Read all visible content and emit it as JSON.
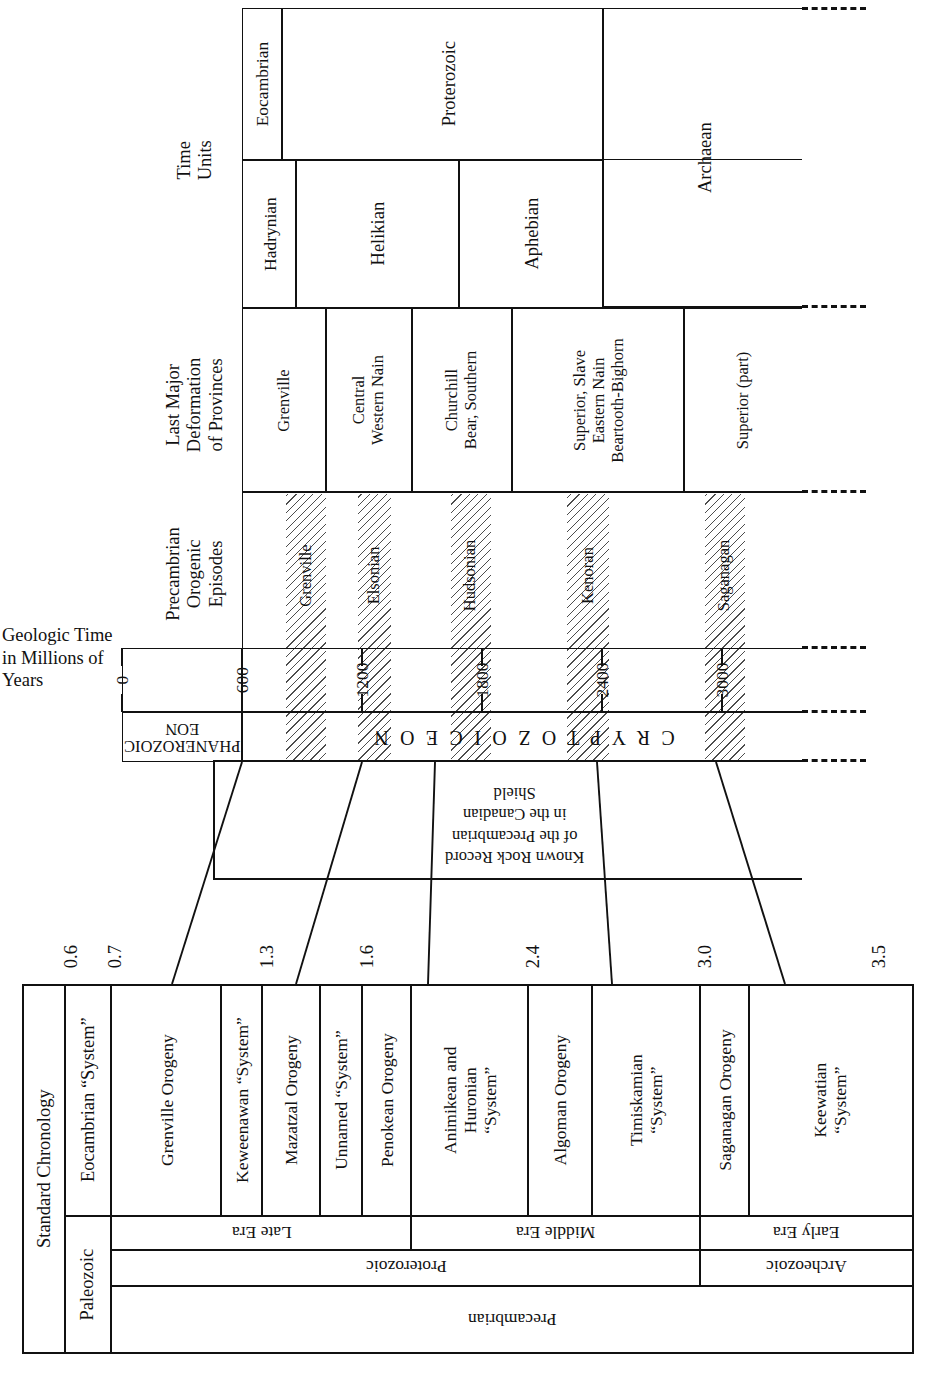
{
  "figure": {
    "orientation": "rotated-90",
    "axis_title": "Geologic Time\nin Millions of\nYears",
    "axis_title_lines": [
      "Geologic Time",
      "in Millions of",
      "Years"
    ],
    "eons": {
      "phanerozoic": "PHANEROZOIC\nEON",
      "phanerozoic_line1": "PHANEROZOIC",
      "phanerozoic_line2": "EON",
      "cryptozoic": "C R Y P T O Z O I C   E O N"
    },
    "rock_record_label_lines": [
      "Known Rock Record",
      "of the Precambrian",
      "in the Canadian",
      "Shield"
    ]
  },
  "axis": {
    "unit": "millions of years",
    "min": 0,
    "max": 3400,
    "ticks": [
      0,
      600,
      1200,
      1800,
      2400,
      3000
    ],
    "tick_labels": [
      "0",
      "600",
      "1200",
      "1800",
      "2400",
      "3000"
    ]
  },
  "columns": {
    "time_units": {
      "header_lines": [
        "Time",
        "Units"
      ]
    },
    "last_deformation": {
      "header_lines": [
        "Last Major",
        "Deformation",
        "of Provinces"
      ]
    },
    "orogenic_episodes": {
      "header_lines": [
        "Precambrian",
        "Orogenic",
        "Episodes"
      ]
    },
    "standard_chronology": {
      "header": "Standard Chronology"
    }
  },
  "time_units_upper": [
    {
      "label": "Eocambrian",
      "start": 600,
      "end": 700
    },
    {
      "label": "Proterozoic",
      "start": 700,
      "end": 2500
    },
    {
      "label": "Archaean",
      "start": 2500,
      "end": 3400
    }
  ],
  "time_units_lower": [
    {
      "label": "Hadrynian",
      "start": 600,
      "end": 880
    },
    {
      "label": "Helikian",
      "start": 880,
      "end": 1740
    },
    {
      "label": "Aphebian",
      "start": 1740,
      "end": 2500
    }
  ],
  "last_deformation": [
    {
      "lines": [
        "Grenville"
      ],
      "start": 700,
      "end": 1190
    },
    {
      "lines": [
        "Central",
        "Western Nain"
      ],
      "start": 1190,
      "end": 1620
    },
    {
      "lines": [
        "Churchill",
        "Bear, Southern"
      ],
      "start": 1620,
      "end": 2120
    },
    {
      "lines": [
        "Superior, Slave",
        "Eastern Nain",
        "Beartooth-Bighorn"
      ],
      "start": 2120,
      "end": 2980
    },
    {
      "lines": [
        "Superior  (part)"
      ],
      "start": 2980,
      "end": 3400
    }
  ],
  "orogenic_episodes": [
    {
      "label": "Grenville",
      "start": 820,
      "end": 1015,
      "hatched": true
    },
    {
      "label": "Elsonian",
      "start": 1290,
      "end": 1440,
      "hatched": true
    },
    {
      "label": "Hudsonian",
      "start": 1680,
      "end": 1880,
      "hatched": true
    },
    {
      "label": "Kenoran",
      "start": 2380,
      "end": 2600,
      "hatched": true
    },
    {
      "label": "Saganagan",
      "start": 3000,
      "end": 3200,
      "hatched": true
    }
  ],
  "standard_chronology": {
    "scale_labels": [
      "0.6",
      "0.7",
      "1.3",
      "1.6",
      "2.4",
      "3.0",
      "3.5"
    ],
    "systems": [
      {
        "label_lines": [
          "Eocambrian “System”"
        ],
        "narrow": true
      },
      {
        "label_lines": [
          "Grenville Orogeny"
        ]
      },
      {
        "label_lines": [
          "Keweenawan “System”"
        ],
        "narrow": true
      },
      {
        "label_lines": [
          "Mazatzal Orogeny"
        ]
      },
      {
        "label_lines": [
          "Unnamed “System”"
        ],
        "narrow": true
      },
      {
        "label_lines": [
          "Penokean Orogeny"
        ]
      },
      {
        "label_lines": [
          "Animikean and",
          "Huronian",
          "“System”"
        ]
      },
      {
        "label_lines": [
          "Algoman Orogeny"
        ]
      },
      {
        "label_lines": [
          "Timiskamian",
          "“System”"
        ]
      },
      {
        "label_lines": [
          "Saganagan Orogeny"
        ]
      },
      {
        "label_lines": [
          "Keewatian",
          "“System”"
        ]
      }
    ],
    "eras": [
      {
        "label": "Late Era"
      },
      {
        "label": "Middle Era"
      },
      {
        "label": "Early Era"
      }
    ],
    "erathems": [
      {
        "label": "Proterozoic"
      },
      {
        "label": "Archeozoic"
      }
    ],
    "eonothem": {
      "label": "Precambrian"
    },
    "paleozoic": {
      "label": "Paleozoic"
    }
  },
  "colors": {
    "ink": "#111111",
    "paper": "#ffffff",
    "hatch": "#9a9a9a"
  }
}
